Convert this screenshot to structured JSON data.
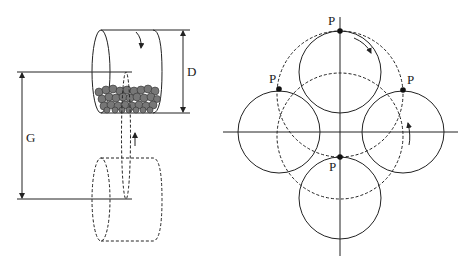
{
  "figure": {
    "left_panel": {
      "description": "Rotating drum with balls orbiting around a central axis",
      "labels": {
        "diameter": "D",
        "gap": "G"
      }
    },
    "right_panel": {
      "description": "Planetary motion of drum: four positions of drum around central axis with point P marked",
      "point_label": "P",
      "points": [
        {
          "name": "top",
          "label": "P"
        },
        {
          "name": "left",
          "label": "P"
        },
        {
          "name": "right",
          "label": "P"
        },
        {
          "name": "bottom",
          "label": "P"
        }
      ]
    },
    "colors": {
      "line": "#222222",
      "ball": "#777777",
      "background": "#ffffff"
    }
  }
}
